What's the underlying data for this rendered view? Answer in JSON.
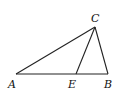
{
  "diagram": {
    "type": "triangle",
    "points": {
      "A": {
        "label": "A",
        "x": 16,
        "y": 74
      },
      "B": {
        "label": "B",
        "x": 108,
        "y": 74
      },
      "C": {
        "label": "C",
        "x": 95,
        "y": 27
      },
      "E": {
        "label": "E",
        "x": 76,
        "y": 74
      }
    },
    "segments": [
      [
        "A",
        "B"
      ],
      [
        "B",
        "C"
      ],
      [
        "C",
        "A"
      ],
      [
        "C",
        "E"
      ]
    ],
    "labels": {
      "A": "A",
      "B": "B",
      "C": "C",
      "E": "E"
    },
    "line_color": "#222222"
  }
}
